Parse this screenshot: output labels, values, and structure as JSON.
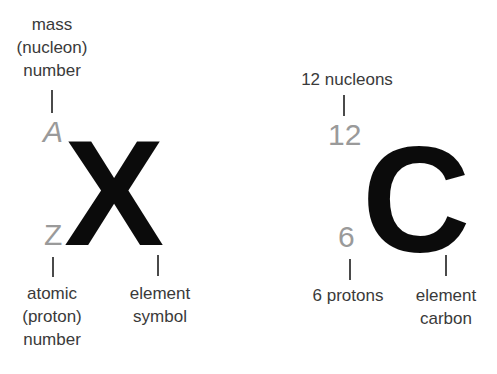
{
  "diagram": {
    "type": "atomic-notation-explainer",
    "background_color": "#ffffff",
    "colors": {
      "symbol": "#0b0b0b",
      "number": "#9a9a9a",
      "annotation_text": "#3a3a3a",
      "tick": "#4a4a4a"
    },
    "generic": {
      "mass_number_label": "mass\n(nucleon)\nnumber",
      "mass_number_value": "A",
      "element_symbol_value": "X",
      "atomic_number_value": "Z",
      "atomic_number_label": "atomic\n(proton)\nnumber",
      "element_symbol_label": "element\nsymbol"
    },
    "example": {
      "nucleons_label": "12 nucleons",
      "mass_number_value": "12",
      "element_symbol_value": "C",
      "atomic_number_value": "6",
      "protons_label": "6 protons",
      "element_label": "element\ncarbon"
    }
  }
}
